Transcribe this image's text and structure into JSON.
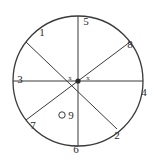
{
  "figure": {
    "type": "geometry-diagram",
    "background_color": "#ffffff",
    "stroke_color": "#3a3a3a",
    "label_color": "#2b2b2b"
  },
  "circle": {
    "center_x": 78,
    "center_y": 81,
    "radius": 65,
    "stroke_width": 1.3
  },
  "center_point": {
    "name": "center-dot",
    "radius": 2.6
  },
  "angle_marks": [
    {
      "id": "x-left",
      "text": "x",
      "x": 70,
      "y": 78
    },
    {
      "id": "x-right",
      "text": "x",
      "x": 88,
      "y": 78
    }
  ],
  "radii": [
    {
      "id": "radius-to-1",
      "angle_deg": 143,
      "label": "1"
    },
    {
      "id": "radius-to-2",
      "angle_deg": -53,
      "label": "2"
    },
    {
      "id": "radius-to-3",
      "angle_deg": 180,
      "label": "3"
    },
    {
      "id": "radius-to-4",
      "angle_deg": 0,
      "label": "4"
    },
    {
      "id": "radius-to-5",
      "angle_deg": 90,
      "label": "5"
    },
    {
      "id": "radius-to-6",
      "angle_deg": -90,
      "label": "6"
    },
    {
      "id": "radius-to-7",
      "angle_deg": -143,
      "label": "7"
    },
    {
      "id": "radius-to-8",
      "angle_deg": 37,
      "label": "8"
    }
  ],
  "labels": [
    {
      "id": "label-1",
      "text": "1",
      "x": 42,
      "y": 33
    },
    {
      "id": "label-5",
      "text": "5",
      "x": 86,
      "y": 22
    },
    {
      "id": "label-8",
      "text": "8",
      "x": 130,
      "y": 45
    },
    {
      "id": "label-3",
      "text": "3",
      "x": 20,
      "y": 80
    },
    {
      "id": "label-4",
      "text": "4",
      "x": 144,
      "y": 93
    },
    {
      "id": "label-7",
      "text": "7",
      "x": 33,
      "y": 126
    },
    {
      "id": "label-9",
      "text": "9",
      "x": 71,
      "y": 116
    },
    {
      "id": "label-2",
      "text": "2",
      "x": 117,
      "y": 136
    },
    {
      "id": "label-6",
      "text": "6",
      "x": 76,
      "y": 150
    }
  ],
  "point_marker_9": {
    "id": "open-circle-marker-9",
    "x": 62,
    "y": 115,
    "radius": 3.2,
    "fill": "none"
  }
}
